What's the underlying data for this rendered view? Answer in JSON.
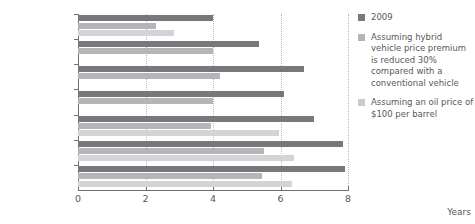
{
  "chart_data": {
    "type": "bar",
    "orientation": "horizontal",
    "title": "",
    "xlabel": "Years",
    "ylabel": "",
    "xlim": [
      0,
      8
    ],
    "xticks": [
      0,
      2,
      4,
      6,
      8
    ],
    "xtick_labels": [
      "0",
      "2",
      "4",
      "6",
      "8"
    ],
    "gridlines": [
      2,
      4,
      6,
      8
    ],
    "grid": true,
    "legend_position": "right",
    "categories": [
      "Germany",
      "France",
      "United Kingdom",
      "United States",
      "Japan",
      "India",
      "China"
    ],
    "series": [
      {
        "name": "2009",
        "color": "#77787b",
        "values": [
          4.0,
          5.35,
          6.7,
          6.1,
          7.0,
          7.85,
          7.9
        ]
      },
      {
        "name": "Assuming hybrid vehicle price premium is reduced 30% compared with a conventional vehicle",
        "color": "#b4b5b7",
        "values": [
          2.3,
          4.0,
          4.2,
          4.0,
          3.95,
          5.5,
          5.45
        ]
      },
      {
        "name": "Assuming an oil price of $100 per barrel",
        "color": "#d3d4d5",
        "values": [
          2.85,
          null,
          null,
          null,
          5.95,
          6.4,
          6.35
        ]
      }
    ]
  },
  "legend": {
    "items": [
      {
        "label": "2009",
        "swatch": "s0"
      },
      {
        "label": "Assuming hybrid vehicle price premium is reduced 30% compared with a conventional vehicle",
        "swatch": "s1"
      },
      {
        "label": "Assuming an oil price of $100 per barrel",
        "swatch": "s2"
      }
    ]
  },
  "axis": {
    "x_title": "Years"
  }
}
